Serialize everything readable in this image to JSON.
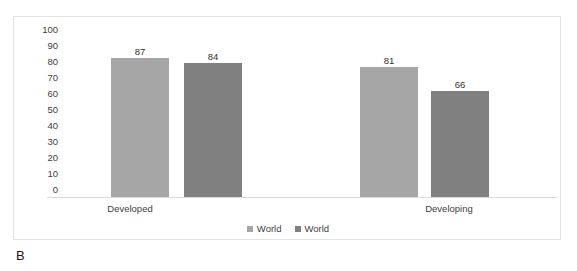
{
  "figure": {
    "caption": "B"
  },
  "chart_data": {
    "type": "bar",
    "title": "",
    "xlabel": "",
    "ylabel": "",
    "ylim": [
      0,
      100
    ],
    "ytick_step": 10,
    "yticks": [
      "100",
      "90",
      "80",
      "70",
      "60",
      "50",
      "40",
      "30",
      "20",
      "10",
      "0"
    ],
    "grid": false,
    "legend_position": "bottom",
    "categories": [
      "Developed",
      "Developing"
    ],
    "series": [
      {
        "name": "World",
        "color": "#a6a6a6",
        "values": [
          87,
          81
        ],
        "labels": [
          "87",
          "81"
        ]
      },
      {
        "name": "World",
        "color": "#808080",
        "values": [
          84,
          66
        ],
        "labels": [
          "84",
          "66"
        ]
      }
    ],
    "legend": [
      {
        "label": "World",
        "color": "#a6a6a6"
      },
      {
        "label": "World",
        "color": "#808080"
      }
    ]
  }
}
